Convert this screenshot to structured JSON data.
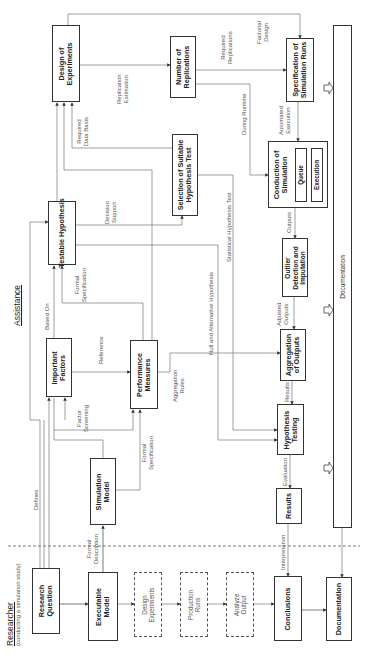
{
  "headers": {
    "researcher": "Researcher",
    "researcher_sub": "(conducting a simulation study)",
    "assistance": "Assistance"
  },
  "boxes": {
    "research_question": "Research\nQuestion",
    "executable_model": "Executable\nModel",
    "simulation_model": "Simulation\nModel",
    "important_factors": "Important\nFactors",
    "performance_measures": "Performance\nMeasures",
    "testable_hypothesis": "Testable Hypothesis",
    "selection_test": "Selection of Suitable\nHypothesis Test",
    "design_of_experiments": "Design of\nExperiments",
    "number_of_replications": "Number of\nReplications",
    "specification_runs": "Specification of\nSimulation Runs",
    "conduction_simulation": "Conduction of\nSimulation",
    "queue": "Queue",
    "execution": "Execution",
    "outlier_detection": "Outlier\nDetection and\nImputation",
    "aggregation_outputs": "Aggregation\nof Outputs",
    "hypothesis_testing": "Hypothesis\nTesting",
    "results": "Results",
    "conclusions": "Conclusions",
    "documentation_small": "Documentation",
    "documentation_bar": "Documentation"
  },
  "dashed_boxes": {
    "design_experiments": "Design\nExperiments",
    "production_runs": "Production\nRuns",
    "analyze_output": "Analyze\nOutput"
  },
  "edge_labels": {
    "defines": "Defines",
    "formal_description": "Formal\nDescription",
    "factor_screening": "Factor\nScreening",
    "formal_specification_1": "Formal\nSpecification",
    "based_on": "Based On",
    "reference": "Reference",
    "formal_specification_2": "Formal\nSpecification",
    "aggregation_rules": "Aggregation\nRules",
    "decision_support": "Decision\nSupport",
    "null_alt_hypothesis": "Null and Alternative Hypothesis",
    "statistical_hypothesis_test": "Statistical Hypothesis Test",
    "required_data_basis": "Required\nData Basis",
    "replication_estimation": "Replication\nEstimation",
    "required_replications": "Required\nReplications",
    "factorial_design": "Factorial\nDesign",
    "during_runtime": "During Runtime",
    "automated_execution": "Automated\nExecution",
    "outputs": "Outputs",
    "adjusted_outputs": "Adjusted\nOutputs",
    "results_edge": "Results",
    "evaluation": "Evaluation",
    "interpretation": "Interpretation"
  },
  "colors": {
    "line": "#555555",
    "box_border": "#333333",
    "text": "#222222",
    "muted_text": "#555555"
  }
}
